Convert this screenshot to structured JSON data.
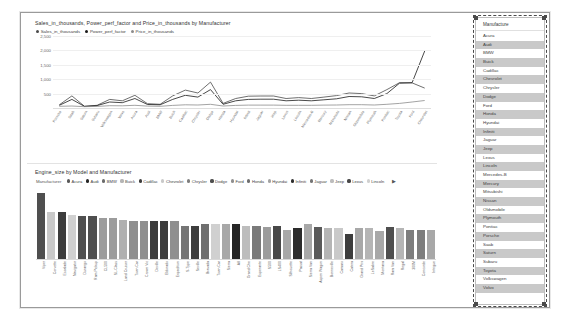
{
  "line_visual": {
    "title": "Sales_in_thousands, Power_perf_factor and Price_in_thousands by Manufacturer",
    "legend": [
      {
        "label": "Sales_in_thousands",
        "color": "#4a4a4a"
      },
      {
        "label": "Power_perf_factor",
        "color": "#1a1a1a"
      },
      {
        "label": "Price_in_thousands",
        "color": "#8c8c8c"
      }
    ]
  },
  "bar_visual": {
    "title": "Engine_size by Model and Manufacturer",
    "legend_title": "Manufacturer",
    "legend": [
      {
        "label": "Acura",
        "color": "#595959"
      },
      {
        "label": "Audi",
        "color": "#262626"
      },
      {
        "label": "BMW",
        "color": "#6b6b6b"
      },
      {
        "label": "Buick",
        "color": "#b5b5b5"
      },
      {
        "label": "Cadillac",
        "color": "#3d3d3d"
      },
      {
        "label": "Chevrolet",
        "color": "#c9c9c9"
      },
      {
        "label": "Chrysler",
        "color": "#7e7e7e"
      },
      {
        "label": "Dodge",
        "color": "#4f4f4f"
      },
      {
        "label": "Ford",
        "color": "#8f8f8f"
      },
      {
        "label": "Honda",
        "color": "#6e6e6e"
      },
      {
        "label": "Hyundai",
        "color": "#a3a3a3"
      },
      {
        "label": "Infiniti",
        "color": "#2e2e2e"
      },
      {
        "label": "Jaguar",
        "color": "#757575"
      },
      {
        "label": "Jeep",
        "color": "#bdbdbd"
      },
      {
        "label": "Lexus",
        "color": "#484848"
      },
      {
        "label": "Lincoln",
        "color": "#d0d0d0"
      }
    ],
    "legend_more": "▶"
  },
  "slicer": {
    "header": "Manufacture",
    "items": [
      "Acura",
      "Audi",
      "BMW",
      "Buick",
      "Cadillac",
      "Chevrolet",
      "Chrysler",
      "Dodge",
      "Ford",
      "Honda",
      "Hyundai",
      "Infiniti",
      "Jaguar",
      "Jeep",
      "Lexus",
      "Lincoln",
      "Mercedes-B",
      "Mercury",
      "Mitsubishi",
      "Nissan",
      "Oldsmobile",
      "Plymouth",
      "Pontiac",
      "Porsche",
      "Saab",
      "Saturn",
      "Subaru",
      "Toyota",
      "Volkswagen",
      "Volvo"
    ]
  },
  "chart_data": [
    {
      "type": "line",
      "title": "Sales_in_thousands, Power_perf_factor and Price_in_thousands by Manufacturer",
      "xlabel": "",
      "ylabel": "",
      "ylim": [
        0,
        2500
      ],
      "yticks": [
        "500",
        "1,000",
        "1,500",
        "2,000",
        "2,500"
      ],
      "grid": true,
      "legend_position": "top",
      "categories": [
        "Porsche",
        "Saab",
        "Saturn",
        "Subaru",
        "Volkswagen",
        "Volvo",
        "Acura",
        "Audi",
        "BMW",
        "Buick",
        "Cadillac",
        "Chrysler",
        "Dodge",
        "Honda",
        "Hyundai",
        "Infiniti",
        "Jaguar",
        "Jeep",
        "Lexus",
        "Lincoln",
        "Mercedes-B",
        "Mercury",
        "Mitsubishi",
        "Nissan",
        "Oldsmobile",
        "Plymouth",
        "Pontiac",
        "Toyota",
        "Ford",
        "Chevrolet"
      ],
      "series": [
        {
          "name": "Sales_in_thousands",
          "color": "#4a4a4a",
          "values": [
            110,
            420,
            60,
            95,
            300,
            250,
            440,
            150,
            130,
            420,
            620,
            520,
            900,
            160,
            330,
            410,
            415,
            415,
            330,
            360,
            330,
            380,
            430,
            520,
            500,
            420,
            640,
            880,
            870,
            690
          ]
        },
        {
          "name": "Power_perf_factor",
          "color": "#1a1a1a",
          "values": [
            95,
            300,
            55,
            85,
            210,
            185,
            330,
            120,
            110,
            300,
            440,
            380,
            640,
            130,
            250,
            300,
            305,
            305,
            250,
            270,
            250,
            285,
            320,
            400,
            390,
            330,
            500,
            860,
            880,
            1980
          ]
        },
        {
          "name": "Price_in_thousands",
          "color": "#8c8c8c",
          "values": [
            60,
            70,
            45,
            55,
            80,
            75,
            95,
            65,
            60,
            90,
            110,
            105,
            130,
            70,
            90,
            100,
            100,
            100,
            95,
            95,
            95,
            100,
            105,
            115,
            115,
            105,
            130,
            160,
            210,
            260
          ]
        }
      ]
    },
    {
      "type": "bar",
      "title": "Engine_size by Model and Manufacturer",
      "xlabel": "",
      "ylabel": "",
      "ylim": [
        0,
        8.5
      ],
      "grid": false,
      "legend_position": "top",
      "categories": [
        "Viper",
        "Corvette",
        "Escalade",
        "Navigator",
        "Durango",
        "Ram Pickup",
        "CL500",
        "SL-Class",
        "Land Cruiser",
        "Town Car",
        "Crown Vic",
        "Deville",
        "Eldorado",
        "Expedition",
        "S-Type",
        "Seville",
        "Bravada",
        "Town Car",
        "Sierra",
        "A8",
        "Grand Che",
        "Esperante",
        "S500",
        "LS400",
        "Silhouette",
        "Passat",
        "Sierra Van",
        "Aspen Wagon",
        "Bonneville",
        "Camaro",
        "Catera",
        "Grand Prix",
        "LeSabre",
        "Montana",
        "Ram Van",
        "Regal",
        "300M",
        "Concorde",
        "Intrigue"
      ],
      "values": [
        8.0,
        5.7,
        5.7,
        5.4,
        5.2,
        5.2,
        5.0,
        5.0,
        4.7,
        4.6,
        4.6,
        4.6,
        4.6,
        4.6,
        4.0,
        4.0,
        4.3,
        4.3,
        4.3,
        4.2,
        4.0,
        4.0,
        3.9,
        4.0,
        3.5,
        3.8,
        4.3,
        3.9,
        3.8,
        3.8,
        3.0,
        3.8,
        3.8,
        3.4,
        3.9,
        3.8,
        3.5,
        3.5,
        3.5
      ],
      "bar_colors": [
        "#4f4f4f",
        "#c9c9c9",
        "#3d3d3d",
        "#d0d0d0",
        "#4f4f4f",
        "#4f4f4f",
        "#9c9c9c",
        "#9c9c9c",
        "#b0b0b0",
        "#8f8f8f",
        "#8f8f8f",
        "#3d3d3d",
        "#3d3d3d",
        "#8f8f8f",
        "#757575",
        "#3d3d3d",
        "#6f6f6f",
        "#d0d0d0",
        "#a8a8a8",
        "#262626",
        "#bdbdbd",
        "#7a7a7a",
        "#9c9c9c",
        "#484848",
        "#a8a8a8",
        "#2b2b2b",
        "#a8a8a8",
        "#5a5a5a",
        "#b5b5b5",
        "#c9c9c9",
        "#3d3d3d",
        "#a8a8a8",
        "#b5b5b5",
        "#a8a8a8",
        "#4f4f4f",
        "#b5b5b5",
        "#7e7e7e",
        "#7e7e7e",
        "#a8a8a8"
      ]
    }
  ]
}
